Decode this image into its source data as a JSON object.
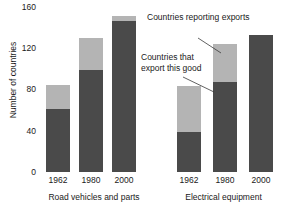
{
  "chart_data": {
    "type": "bar",
    "title": "",
    "xlabel": "",
    "ylabel": "Number of countries",
    "ylim": [
      0,
      160
    ],
    "yticks": [
      0,
      40,
      80,
      120,
      160
    ],
    "grid": false,
    "stacked": true,
    "legend_position": "inline-annotation",
    "groups": [
      {
        "name": "Road vehicles and parts",
        "categories": [
          "1962",
          "1980",
          "2000"
        ],
        "series": [
          {
            "name": "Countries that export this good",
            "color": "#4a4a4a",
            "values": [
              60,
              97,
              143
            ]
          },
          {
            "name": "Countries reporting exports",
            "color": "#b4b4b4",
            "values": [
              82,
              127,
              148
            ]
          }
        ]
      },
      {
        "name": "Electrical equipment",
        "categories": [
          "1962",
          "1980",
          "2000"
        ],
        "series": [
          {
            "name": "Countries that export this good",
            "color": "#4a4a4a",
            "values": [
              38,
              85,
              130
            ]
          },
          {
            "name": "Countries reporting exports",
            "color": "#b4b4b4",
            "values": [
              81,
              121,
              130
            ]
          }
        ]
      }
    ],
    "annotations": [
      {
        "id": "reporting",
        "text": "Countries reporting exports",
        "points_to": "light-gray-segment"
      },
      {
        "id": "export",
        "text": "Countries that export this good",
        "points_to": "dark-gray-segment"
      }
    ]
  },
  "axis": {
    "y_title": "Number of countries",
    "y_ticks": [
      "160",
      "120",
      "80",
      "40",
      "0"
    ]
  },
  "annotations": {
    "reporting": "Countries reporting exports",
    "export": "Countries that export this good"
  },
  "groups": {
    "road": {
      "label": "Road vehicles and parts",
      "ticks": [
        "1962",
        "1980",
        "2000"
      ]
    },
    "electrical": {
      "label": "Electrical equipment",
      "ticks": [
        "1962",
        "1980",
        "2000"
      ]
    }
  },
  "colors": {
    "reporting": "#b4b4b4",
    "export": "#4a4a4a",
    "text": "#1a1a1a",
    "background": "#ffffff"
  }
}
